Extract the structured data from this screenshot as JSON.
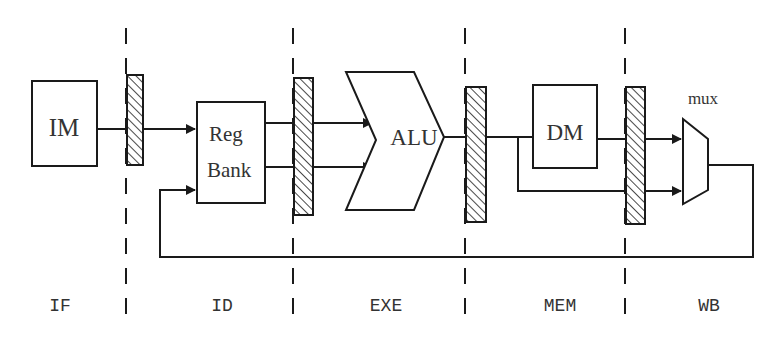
{
  "diagram": {
    "type": "5-stage pipeline datapath",
    "components": {
      "instruction_memory": {
        "label": "IM"
      },
      "register_bank": {
        "label_line1": "Reg",
        "label_line2": "Bank"
      },
      "alu": {
        "label": "ALU"
      },
      "data_memory": {
        "label": "DM"
      },
      "mux": {
        "label": "mux"
      }
    },
    "stages": [
      {
        "label": "IF"
      },
      {
        "label": "ID"
      },
      {
        "label": "EXE"
      },
      {
        "label": "MEM"
      },
      {
        "label": "WB"
      }
    ],
    "pipeline_registers": [
      "IF/ID",
      "ID/EXE",
      "EXE/MEM",
      "MEM/WB"
    ],
    "colors": {
      "stroke": "#1a1a1a",
      "text": "#333333",
      "background": "#ffffff"
    }
  }
}
